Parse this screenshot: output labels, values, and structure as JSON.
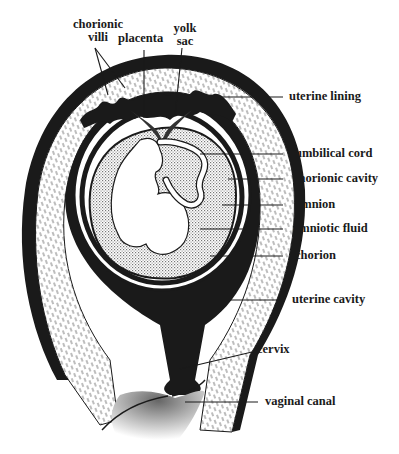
{
  "diagram": {
    "colors": {
      "ink": "#1a1a1a",
      "background": "#ffffff",
      "fluid_stipple": "#9a9a9a"
    },
    "labels": {
      "chorionic_villi": "chorionic villi",
      "chorionic_villi_line1": "chorionic",
      "chorionic_villi_line2": "villi",
      "placenta": "placenta",
      "yolk_sac_line1": "yolk",
      "yolk_sac_line2": "sac",
      "uterine_lining": "uterine lining",
      "umbilical_cord": "umbilical cord",
      "chorionic_cavity": "chorionic cavity",
      "amnion": "amnion",
      "amniotic_fluid": "amniotic fluid",
      "chorion": "chorion",
      "uterine_cavity": "uterine cavity",
      "cervix": "cervix",
      "vaginal_canal": "vaginal canal"
    }
  }
}
